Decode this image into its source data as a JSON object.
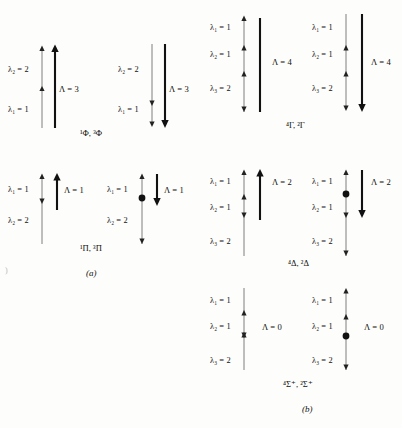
{
  "figure": {
    "background_color": "#fdfdfb",
    "ink_color": "#111111",
    "thin_line_color": "#6f6f6f",
    "panels": [
      {
        "id": "a",
        "caption": "(a)",
        "rows": [
          {
            "id": "a-row1",
            "term": "¹Φ, ³Φ",
            "diagrams": [
              {
                "id": "a1-left",
                "direction": "up",
                "has_node_dot": false,
                "lambda_labels": [
                  "λ₂ = 2",
                  "λ₁ = 1"
                ],
                "resultant_label": "Λ = 3"
              },
              {
                "id": "a1-right",
                "direction": "down",
                "has_node_dot": false,
                "lambda_labels": [
                  "λ₂ = 2",
                  "λ₁ = 1"
                ],
                "resultant_label": "Λ = 3"
              }
            ]
          },
          {
            "id": "a-row2",
            "term": "¹Π, ³Π",
            "diagrams": [
              {
                "id": "a2-left",
                "direction": "up",
                "has_node_dot": false,
                "lambda_labels": [
                  "λ₁ = 1",
                  "λ₂ = 2"
                ],
                "resultant_label": "Λ = 1"
              },
              {
                "id": "a2-right",
                "direction": "down",
                "has_node_dot": true,
                "lambda_labels": [
                  "λ₁ = 1",
                  "λ₂ = 2"
                ],
                "resultant_label": "Λ = 1"
              }
            ]
          }
        ]
      },
      {
        "id": "b",
        "caption": "(b)",
        "rows": [
          {
            "id": "b-row1",
            "term": "⁴Γ, ²Γ",
            "diagrams": [
              {
                "id": "b1-left",
                "direction": "up",
                "has_node_dot": false,
                "lambda_labels": [
                  "λ₁ = 1",
                  "λ₂ = 1",
                  "λ₃ = 2"
                ],
                "resultant_label": "Λ = 4"
              },
              {
                "id": "b1-right",
                "direction": "down",
                "has_node_dot": false,
                "lambda_labels": [
                  "λ₁ = 1",
                  "λ₂ = 1",
                  "λ₃ = 2"
                ],
                "resultant_label": "Λ = 4"
              }
            ]
          },
          {
            "id": "b-row2",
            "term": "⁴Δ, ²Δ",
            "diagrams": [
              {
                "id": "b2-left",
                "direction": "up",
                "has_node_dot": false,
                "lambda_labels": [
                  "λ₁ = 1",
                  "λ₂ = 1",
                  "λ₃ = 2"
                ],
                "resultant_label": "Λ = 2"
              },
              {
                "id": "b2-right",
                "direction": "down",
                "has_node_dot": true,
                "lambda_labels": [
                  "λ₁ = 1",
                  "λ₂ = 1",
                  "λ₃ = 2"
                ],
                "resultant_label": "Λ = 2"
              }
            ]
          },
          {
            "id": "b-row3",
            "term": "⁴Σ⁺, ²Σ⁺",
            "diagrams": [
              {
                "id": "b3-left",
                "direction": "up",
                "has_node_dot": false,
                "lambda_labels": [
                  "λ₁ = 1",
                  "λ₂ = 1",
                  "λ₃ = 2"
                ],
                "resultant_label": "Λ = 0"
              },
              {
                "id": "b3-right",
                "direction": "down",
                "has_node_dot": true,
                "lambda_labels": [
                  "λ₁ = 1",
                  "λ₂ = 1",
                  "λ₃ = 2"
                ],
                "resultant_label": "Λ = 0"
              }
            ]
          }
        ]
      }
    ],
    "stray_mark": ")"
  }
}
